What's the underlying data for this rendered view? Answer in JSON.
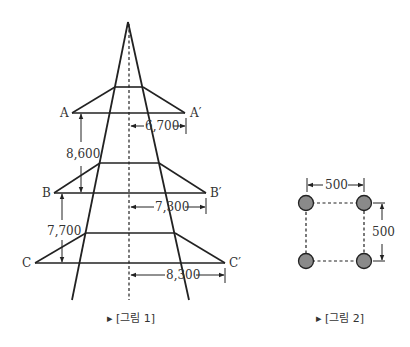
{
  "figure1": {
    "caption": "▸ [그림 1]",
    "labels": {
      "A": "A",
      "A_prime": "A′",
      "B": "B",
      "B_prime": "B′",
      "C": "C",
      "C_prime": "C′"
    },
    "dimensions": {
      "A_half_span": "6,700",
      "B_half_span": "7,300",
      "C_half_span": "8,300",
      "A_to_B": "8,600",
      "B_to_C": "7,700"
    }
  },
  "figure2": {
    "caption": "▸ [그림 2]",
    "dimensions": {
      "width": "500",
      "height": "500"
    },
    "conductor_color": "#8a8a8a"
  },
  "colors": {
    "line": "#222222",
    "background": "#ffffff"
  }
}
